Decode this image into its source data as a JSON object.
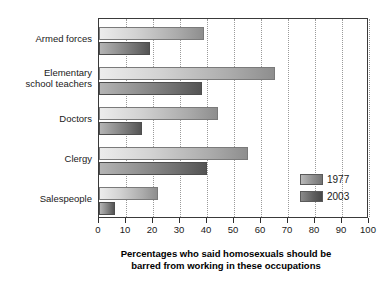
{
  "chart_data": {
    "type": "bar",
    "orientation": "horizontal",
    "title": "",
    "xlabel": "Percentages who said homosexuals should be barred from working in these occupations",
    "xlabel_line1": "Percentages who said homosexuals should be",
    "xlabel_line2": "barred from working in these occupations",
    "ylabel": "",
    "categories": [
      "Armed forces",
      "Elementary school teachers",
      "Doctors",
      "Clergy",
      "Salespeople"
    ],
    "category_lines": [
      [
        "Armed forces"
      ],
      [
        "Elementary",
        "school teachers"
      ],
      [
        "Doctors"
      ],
      [
        "Clergy"
      ],
      [
        "Salespeople"
      ]
    ],
    "series": [
      {
        "name": "1977",
        "values": [
          39,
          65,
          44,
          55,
          22
        ],
        "color": "#b0b0b0"
      },
      {
        "name": "2003",
        "values": [
          19,
          38,
          16,
          40,
          6
        ],
        "color": "#5e5e5e"
      }
    ],
    "xlim": [
      0,
      100
    ],
    "xticks": [
      0,
      10,
      20,
      30,
      40,
      50,
      60,
      70,
      80,
      90,
      100
    ],
    "xtick_labels": [
      "0",
      "10",
      "20",
      "30",
      "40",
      "50",
      "60",
      "70",
      "80",
      "90",
      "100"
    ],
    "grid": true,
    "grid_axis": "x",
    "grid_style": "dotted",
    "legend_position": "bottom-right",
    "legend_entries": [
      "1977",
      "2003"
    ]
  }
}
